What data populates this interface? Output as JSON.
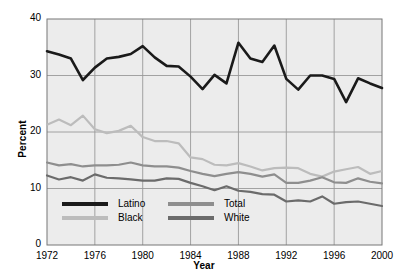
{
  "chart_data": {
    "type": "line",
    "title": "",
    "xlabel": "Year",
    "ylabel": "Percent",
    "xlim": [
      1972,
      2000
    ],
    "ylim": [
      0,
      40
    ],
    "ytick_labels": [
      "0",
      "10",
      "20",
      "30",
      "40"
    ],
    "ytick_values": [
      0,
      10,
      20,
      30,
      40
    ],
    "xtick_labels": [
      "1972",
      "1976",
      "1980",
      "1984",
      "1988",
      "1992",
      "1996",
      "2000"
    ],
    "xtick_values": [
      1972,
      1976,
      1980,
      1984,
      1988,
      1992,
      1996,
      2000
    ],
    "grid": true,
    "legend_position": "inside-bottom-left",
    "x": [
      1972,
      1973,
      1974,
      1975,
      1976,
      1977,
      1978,
      1979,
      1980,
      1981,
      1982,
      1983,
      1984,
      1985,
      1986,
      1987,
      1988,
      1989,
      1990,
      1991,
      1992,
      1993,
      1994,
      1995,
      1996,
      1997,
      1998,
      1999,
      2000
    ],
    "series": [
      {
        "name": "Latino",
        "color": "#1a1a1a",
        "values": [
          34.3,
          33.7,
          33.0,
          29.2,
          31.4,
          33.0,
          33.3,
          33.8,
          35.2,
          33.2,
          31.7,
          31.6,
          29.8,
          27.6,
          30.1,
          28.6,
          35.8,
          33.0,
          32.4,
          35.3,
          29.4,
          27.5,
          30.0,
          30.0,
          29.4,
          25.3,
          29.5,
          28.6,
          27.8
        ]
      },
      {
        "name": "Black",
        "color": "#bcbcbc",
        "values": [
          21.3,
          22.2,
          21.2,
          22.9,
          20.5,
          19.8,
          20.2,
          21.1,
          19.1,
          18.4,
          18.4,
          18.0,
          15.5,
          15.2,
          14.2,
          14.1,
          14.5,
          13.9,
          13.2,
          13.6,
          13.7,
          13.6,
          12.6,
          12.1,
          13.0,
          13.4,
          13.8,
          12.6,
          13.1
        ]
      },
      {
        "name": "Total",
        "color": "#8e8e8e",
        "values": [
          14.6,
          14.1,
          14.3,
          13.9,
          14.1,
          14.1,
          14.2,
          14.6,
          14.1,
          13.9,
          13.9,
          13.7,
          13.1,
          12.6,
          12.2,
          12.6,
          12.9,
          12.6,
          12.1,
          12.5,
          11.0,
          11.0,
          11.4,
          12.0,
          11.1,
          11.0,
          11.8,
          11.2,
          10.9
        ]
      },
      {
        "name": "White",
        "color": "#6b6b6b",
        "values": [
          12.3,
          11.6,
          12.0,
          11.4,
          12.5,
          11.9,
          11.8,
          11.6,
          11.4,
          11.4,
          11.8,
          11.7,
          11.0,
          10.4,
          9.7,
          10.4,
          9.6,
          9.4,
          9.0,
          8.9,
          7.7,
          7.9,
          7.7,
          8.6,
          7.3,
          7.6,
          7.7,
          7.3,
          6.9
        ]
      }
    ]
  },
  "legend": {
    "items": [
      {
        "label": "Latino",
        "color": "#1a1a1a"
      },
      {
        "label": "Black",
        "color": "#bcbcbc"
      },
      {
        "label": "Total",
        "color": "#8e8e8e"
      },
      {
        "label": "White",
        "color": "#6b6b6b"
      }
    ]
  },
  "style": {
    "plot_background": "#ececec",
    "grid_color": "#9a9a9a",
    "border_color": "#777777"
  }
}
